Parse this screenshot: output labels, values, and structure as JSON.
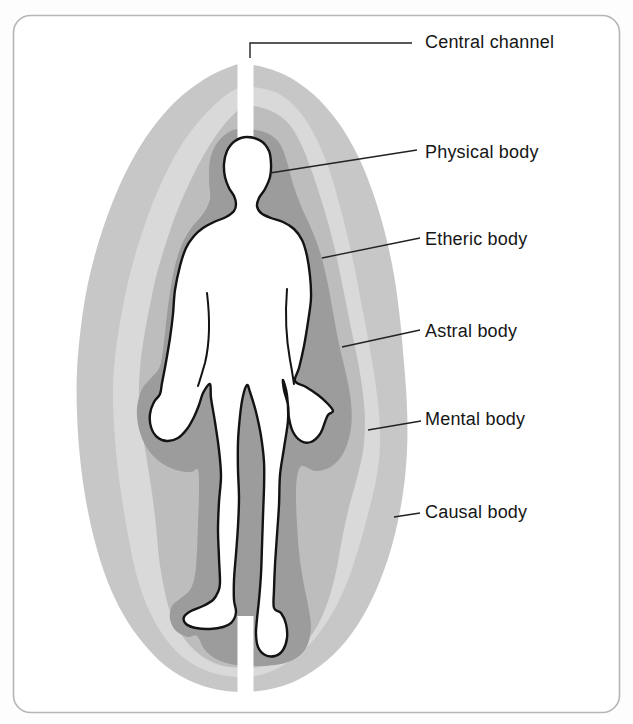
{
  "diagram": {
    "labels": [
      {
        "text": "Central channel"
      },
      {
        "text": "Physical body"
      },
      {
        "text": "Etheric body"
      },
      {
        "text": "Astral body"
      },
      {
        "text": "Mental body"
      },
      {
        "text": "Causal body"
      }
    ],
    "colors": {
      "background": "#fdfdfd",
      "frame_border": "#b5b5b5",
      "frame_fill": "#ffffff",
      "causal": "#c7c7c7",
      "mental": "#d9d9d9",
      "astral": "#bdbdbd",
      "etheric": "#9c9c9c",
      "body_fill": "#ffffff",
      "body_outline": "#131313",
      "central_channel": "#ffffff",
      "leader_line": "#222222",
      "label_text": "#161616"
    }
  }
}
